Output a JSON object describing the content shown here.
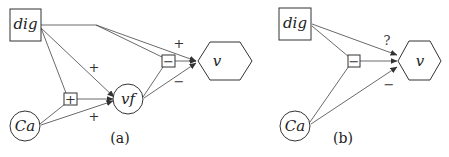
{
  "panels": [
    {
      "id": "a",
      "caption": "(a)",
      "nodes": {
        "dig": "dig",
        "ca": "Ca",
        "vf": "vf",
        "v": "v",
        "plus_junction": "+",
        "minus_junction": "−"
      },
      "edge_labels": {
        "dig_to_vf": "+",
        "ca_to_vf": "+",
        "dig_to_v": "+",
        "vf_to_v": "−"
      }
    },
    {
      "id": "b",
      "caption": "(b)",
      "nodes": {
        "dig": "dig",
        "ca": "Ca",
        "v": "v",
        "minus_junction": "−"
      },
      "edge_labels": {
        "dig_to_v": "?",
        "ca_to_v": "−"
      }
    }
  ]
}
